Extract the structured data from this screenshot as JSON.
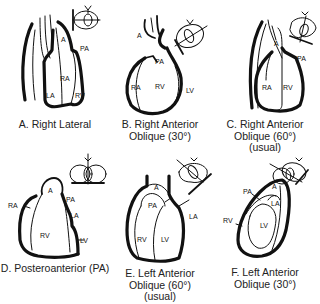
{
  "figure": {
    "panels": [
      {
        "id": "A",
        "caption_lines": [
          "A. Right Lateral"
        ],
        "labels": [
          "A",
          "PA",
          "RA",
          "LA",
          "RV"
        ]
      },
      {
        "id": "B",
        "caption_lines": [
          "B. Right Anterior",
          "Oblique (30°)"
        ],
        "labels": [
          "A",
          "PA",
          "RA",
          "RV",
          "LV"
        ]
      },
      {
        "id": "C",
        "caption_lines": [
          "C. Right Anterior",
          "Oblique (60°)",
          "(usual)"
        ],
        "labels": [
          "A",
          "PA",
          "RA",
          "RV"
        ]
      },
      {
        "id": "D",
        "caption_lines": [
          "D. Posteroanterior (PA)"
        ],
        "labels": [
          "A",
          "RA",
          "PA",
          "LA",
          "RV",
          "LV"
        ]
      },
      {
        "id": "E",
        "caption_lines": [
          "E. Left Anterior",
          "Oblique (60°)",
          "(usual)"
        ],
        "labels": [
          "A",
          "PA",
          "LA",
          "RV",
          "LV"
        ]
      },
      {
        "id": "F",
        "caption_lines": [
          "F. Left Anterior",
          "Oblique (30°)"
        ],
        "labels": [
          "A",
          "PA",
          "LA",
          "RV",
          "LV"
        ]
      }
    ]
  }
}
